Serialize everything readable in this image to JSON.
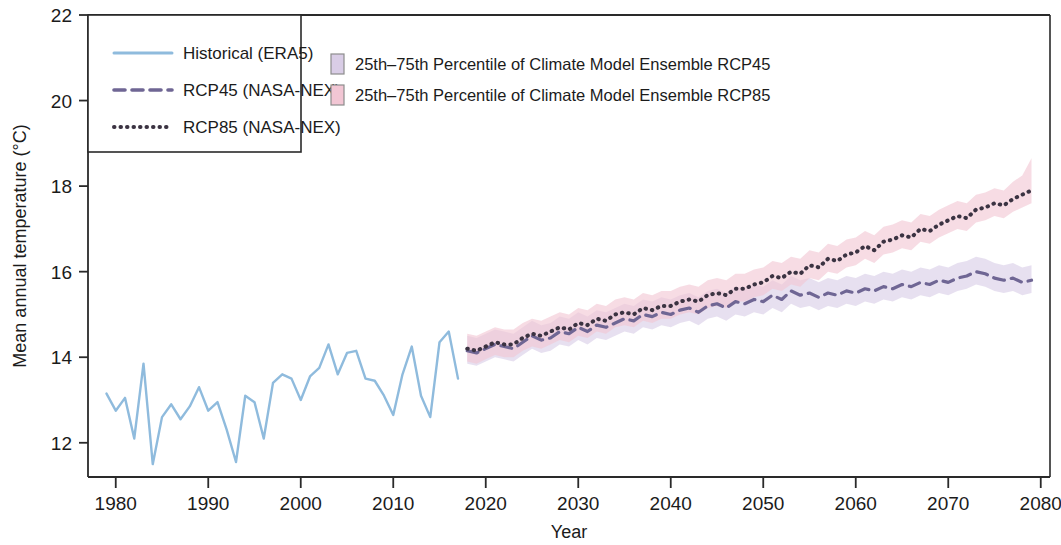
{
  "legend": {
    "box": {
      "entries": [
        {
          "label": "Historical (ERA5)",
          "style": "solid",
          "color": "#8fbbdd",
          "name": "historical"
        },
        {
          "label": "RCP45 (NASA-NEX)",
          "style": "dashed",
          "color": "#6f6694",
          "name": "rcp45"
        },
        {
          "label": "RCP85 (NASA-NEX)",
          "style": "dotted",
          "color": "#3b3342",
          "name": "rcp85"
        }
      ]
    },
    "bands": [
      {
        "label": "25th–75th Percentile of Climate Model Ensemble RCP45",
        "color": "#d9cde6",
        "name": "rcp45-band"
      },
      {
        "label": "25th–75th Percentile of Climate Model Ensemble RCP85",
        "color": "#f2c6d4",
        "name": "rcp85-band"
      }
    ]
  },
  "chart_data": {
    "type": "line",
    "title": "",
    "xlabel": "Year",
    "ylabel": "Mean annual temperature (°C)",
    "xlim": [
      1977,
      2081
    ],
    "ylim": [
      11.2,
      22
    ],
    "xticks": [
      1980,
      1990,
      2000,
      2010,
      2020,
      2030,
      2040,
      2050,
      2060,
      2070,
      2080
    ],
    "yticks": [
      12,
      14,
      16,
      18,
      20,
      22
    ],
    "grid": false,
    "legend_position": "top-left",
    "series": [
      {
        "name": "Historical (ERA5)",
        "style": "solid",
        "color": "#8fbbdd",
        "x": [
          1979,
          1980,
          1981,
          1982,
          1983,
          1984,
          1985,
          1986,
          1987,
          1988,
          1989,
          1990,
          1991,
          1992,
          1993,
          1994,
          1995,
          1996,
          1997,
          1998,
          1999,
          2000,
          2001,
          2002,
          2003,
          2004,
          2005,
          2006,
          2007,
          2008,
          2009,
          2010,
          2011,
          2012,
          2013,
          2014,
          2015,
          2016,
          2017
        ],
        "values": [
          13.15,
          12.75,
          13.05,
          12.1,
          13.85,
          11.5,
          12.6,
          12.9,
          12.55,
          12.85,
          13.3,
          12.75,
          12.95,
          12.3,
          11.55,
          13.1,
          12.95,
          12.1,
          13.4,
          13.6,
          13.5,
          13.0,
          13.55,
          13.75,
          14.3,
          13.6,
          14.1,
          14.15,
          13.5,
          13.45,
          13.1,
          12.65,
          13.6,
          14.25,
          13.1,
          12.6,
          14.35,
          14.6,
          13.5
        ]
      },
      {
        "name": "RCP45 (NASA-NEX)",
        "style": "dashed",
        "color": "#6f6694",
        "x": [
          2018,
          2019,
          2020,
          2021,
          2022,
          2023,
          2024,
          2025,
          2026,
          2027,
          2028,
          2029,
          2030,
          2031,
          2032,
          2033,
          2034,
          2035,
          2036,
          2037,
          2038,
          2039,
          2040,
          2041,
          2042,
          2043,
          2044,
          2045,
          2046,
          2047,
          2048,
          2049,
          2050,
          2051,
          2052,
          2053,
          2054,
          2055,
          2056,
          2057,
          2058,
          2059,
          2060,
          2061,
          2062,
          2063,
          2064,
          2065,
          2066,
          2067,
          2068,
          2069,
          2070,
          2071,
          2072,
          2073,
          2074,
          2075,
          2076,
          2077,
          2078,
          2079
        ],
        "values": [
          14.15,
          14.1,
          14.2,
          14.3,
          14.25,
          14.2,
          14.35,
          14.5,
          14.4,
          14.45,
          14.6,
          14.55,
          14.7,
          14.6,
          14.75,
          14.7,
          14.8,
          14.9,
          14.85,
          15.0,
          14.95,
          15.05,
          15.0,
          15.1,
          15.15,
          15.05,
          15.2,
          15.25,
          15.15,
          15.3,
          15.25,
          15.35,
          15.3,
          15.45,
          15.35,
          15.55,
          15.45,
          15.5,
          15.4,
          15.5,
          15.45,
          15.55,
          15.5,
          15.6,
          15.55,
          15.65,
          15.6,
          15.7,
          15.65,
          15.75,
          15.7,
          15.8,
          15.75,
          15.85,
          15.9,
          16.0,
          15.95,
          15.85,
          15.8,
          15.85,
          15.75,
          15.8
        ]
      },
      {
        "name": "RCP85 (NASA-NEX)",
        "style": "dotted",
        "color": "#3b3342",
        "x": [
          2018,
          2019,
          2020,
          2021,
          2022,
          2023,
          2024,
          2025,
          2026,
          2027,
          2028,
          2029,
          2030,
          2031,
          2032,
          2033,
          2034,
          2035,
          2036,
          2037,
          2038,
          2039,
          2040,
          2041,
          2042,
          2043,
          2044,
          2045,
          2046,
          2047,
          2048,
          2049,
          2050,
          2051,
          2052,
          2053,
          2054,
          2055,
          2056,
          2057,
          2058,
          2059,
          2060,
          2061,
          2062,
          2063,
          2064,
          2065,
          2066,
          2067,
          2068,
          2069,
          2070,
          2071,
          2072,
          2073,
          2074,
          2075,
          2076,
          2077,
          2078,
          2079
        ],
        "values": [
          14.2,
          14.15,
          14.25,
          14.35,
          14.3,
          14.3,
          14.45,
          14.55,
          14.5,
          14.6,
          14.7,
          14.65,
          14.8,
          14.75,
          14.9,
          14.85,
          15.0,
          15.05,
          15.0,
          15.15,
          15.1,
          15.2,
          15.2,
          15.3,
          15.35,
          15.3,
          15.45,
          15.5,
          15.45,
          15.6,
          15.6,
          15.7,
          15.75,
          15.9,
          15.85,
          16.0,
          15.95,
          16.15,
          16.1,
          16.3,
          16.25,
          16.4,
          16.45,
          16.6,
          16.5,
          16.7,
          16.75,
          16.85,
          16.8,
          17.0,
          16.95,
          17.1,
          17.2,
          17.3,
          17.25,
          17.45,
          17.5,
          17.6,
          17.55,
          17.7,
          17.8,
          17.9
        ]
      }
    ],
    "bands": [
      {
        "name": "25th–75th Percentile of Climate Model Ensemble RCP45",
        "color": "#d9cde6",
        "x": [
          2018,
          2019,
          2020,
          2021,
          2022,
          2023,
          2024,
          2025,
          2026,
          2027,
          2028,
          2029,
          2030,
          2031,
          2032,
          2033,
          2034,
          2035,
          2036,
          2037,
          2038,
          2039,
          2040,
          2041,
          2042,
          2043,
          2044,
          2045,
          2046,
          2047,
          2048,
          2049,
          2050,
          2051,
          2052,
          2053,
          2054,
          2055,
          2056,
          2057,
          2058,
          2059,
          2060,
          2061,
          2062,
          2063,
          2064,
          2065,
          2066,
          2067,
          2068,
          2069,
          2070,
          2071,
          2072,
          2073,
          2074,
          2075,
          2076,
          2077,
          2078,
          2079
        ],
        "lower": [
          13.85,
          13.8,
          13.9,
          14.0,
          13.95,
          13.9,
          14.05,
          14.2,
          14.1,
          14.15,
          14.3,
          14.25,
          14.4,
          14.3,
          14.45,
          14.4,
          14.5,
          14.6,
          14.55,
          14.7,
          14.65,
          14.75,
          14.7,
          14.8,
          14.85,
          14.75,
          14.9,
          14.95,
          14.85,
          15.0,
          14.95,
          15.05,
          15.0,
          15.15,
          15.05,
          15.25,
          15.15,
          15.2,
          15.1,
          15.2,
          15.15,
          15.25,
          15.2,
          15.3,
          15.25,
          15.35,
          15.3,
          15.4,
          15.35,
          15.45,
          15.4,
          15.5,
          15.45,
          15.55,
          15.6,
          15.7,
          15.65,
          15.55,
          15.5,
          15.55,
          15.45,
          15.5
        ],
        "upper": [
          14.5,
          14.45,
          14.55,
          14.65,
          14.6,
          14.55,
          14.7,
          14.85,
          14.75,
          14.8,
          14.95,
          14.9,
          15.05,
          14.95,
          15.1,
          15.05,
          15.15,
          15.25,
          15.2,
          15.35,
          15.3,
          15.4,
          15.35,
          15.45,
          15.5,
          15.4,
          15.55,
          15.6,
          15.5,
          15.65,
          15.6,
          15.7,
          15.65,
          15.8,
          15.7,
          15.9,
          15.8,
          15.85,
          15.75,
          15.85,
          15.8,
          15.9,
          15.85,
          15.95,
          15.9,
          16.0,
          15.95,
          16.05,
          16.0,
          16.1,
          16.05,
          16.15,
          16.1,
          16.2,
          16.25,
          16.35,
          16.3,
          16.2,
          16.15,
          16.2,
          16.1,
          16.15
        ]
      },
      {
        "name": "25th–75th Percentile of Climate Model Ensemble RCP85",
        "color": "#f2c6d4",
        "x": [
          2018,
          2019,
          2020,
          2021,
          2022,
          2023,
          2024,
          2025,
          2026,
          2027,
          2028,
          2029,
          2030,
          2031,
          2032,
          2033,
          2034,
          2035,
          2036,
          2037,
          2038,
          2039,
          2040,
          2041,
          2042,
          2043,
          2044,
          2045,
          2046,
          2047,
          2048,
          2049,
          2050,
          2051,
          2052,
          2053,
          2054,
          2055,
          2056,
          2057,
          2058,
          2059,
          2060,
          2061,
          2062,
          2063,
          2064,
          2065,
          2066,
          2067,
          2068,
          2069,
          2070,
          2071,
          2072,
          2073,
          2074,
          2075,
          2076,
          2077,
          2078,
          2079
        ],
        "lower": [
          13.9,
          13.85,
          13.95,
          14.05,
          14.0,
          14.0,
          14.15,
          14.25,
          14.2,
          14.3,
          14.4,
          14.35,
          14.5,
          14.45,
          14.6,
          14.55,
          14.7,
          14.75,
          14.7,
          14.85,
          14.8,
          14.9,
          14.9,
          15.0,
          15.05,
          15.0,
          15.15,
          15.2,
          15.15,
          15.3,
          15.3,
          15.4,
          15.45,
          15.6,
          15.55,
          15.7,
          15.65,
          15.85,
          15.8,
          16.0,
          15.95,
          16.1,
          16.15,
          16.3,
          16.2,
          16.4,
          16.45,
          16.55,
          16.5,
          16.7,
          16.65,
          16.8,
          16.9,
          17.0,
          16.95,
          17.15,
          17.2,
          17.3,
          17.25,
          17.4,
          17.5,
          17.6
        ],
        "upper": [
          14.55,
          14.5,
          14.6,
          14.7,
          14.65,
          14.65,
          14.8,
          14.9,
          14.85,
          14.95,
          15.05,
          15.0,
          15.15,
          15.1,
          15.25,
          15.2,
          15.35,
          15.4,
          15.35,
          15.5,
          15.45,
          15.55,
          15.55,
          15.65,
          15.7,
          15.65,
          15.8,
          15.85,
          15.8,
          15.95,
          15.95,
          16.05,
          16.1,
          16.25,
          16.2,
          16.35,
          16.3,
          16.5,
          16.45,
          16.65,
          16.6,
          16.75,
          16.8,
          16.95,
          16.85,
          17.05,
          17.1,
          17.2,
          17.15,
          17.35,
          17.3,
          17.45,
          17.55,
          17.65,
          17.6,
          17.8,
          17.85,
          17.95,
          17.9,
          18.1,
          18.25,
          18.65
        ]
      }
    ]
  }
}
